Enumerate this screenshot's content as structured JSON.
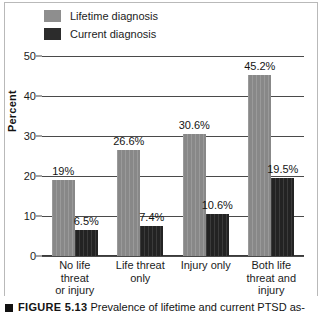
{
  "figure": {
    "marker_icon": "black-square-icon",
    "number_label": "FIGURE 5.13",
    "caption_text": "Prevalence of lifetime and current PTSD as-"
  },
  "legend": {
    "items": [
      {
        "label": "Lifetime diagnosis",
        "color": "#8e8e8e"
      },
      {
        "label": "Current diagnosis",
        "color": "#2c2c2c"
      }
    ]
  },
  "axes": {
    "ylabel": "Percent",
    "yticks": [
      "0",
      "10",
      "20",
      "30",
      "40",
      "50"
    ]
  },
  "chart_data": {
    "type": "bar",
    "title": "",
    "xlabel": "",
    "ylabel": "Percent",
    "ylim": [
      0,
      50
    ],
    "yticks": [
      0,
      10,
      20,
      30,
      40,
      50
    ],
    "grid": "horizontal",
    "legend_position": "top-left",
    "categories": [
      "No life threat or injury",
      "Life threat only",
      "Injury only",
      "Both life threat and injury"
    ],
    "category_lines": [
      [
        "No life threat",
        "or injury"
      ],
      [
        "Life threat",
        "only"
      ],
      [
        "Injury only"
      ],
      [
        "Both life",
        "threat and",
        "injury"
      ]
    ],
    "series": [
      {
        "name": "Lifetime diagnosis",
        "color": "#8e8e8e",
        "values": [
          19,
          26.6,
          30.6,
          45.2
        ],
        "labels": [
          "19%",
          "26.6%",
          "30.6%",
          "45.2%"
        ]
      },
      {
        "name": "Current diagnosis",
        "color": "#2c2c2c",
        "values": [
          6.5,
          7.4,
          10.6,
          19.5
        ],
        "labels": [
          "6.5%",
          "7.4%",
          "10.6%",
          "19.5%"
        ]
      }
    ]
  }
}
